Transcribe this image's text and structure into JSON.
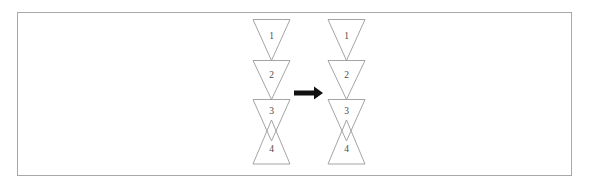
{
  "figure": {
    "title": "",
    "background_color": "#ffffff",
    "frame": {
      "border_color": "#a8a8a8",
      "x": 17,
      "y": 12,
      "width": 555,
      "height": 164
    },
    "stroke_color": "#9a9a9a",
    "label_color": "#4a4a4a",
    "arrow_color": "#111111"
  },
  "panels": [
    {
      "name": "left-panel",
      "center_x": 271.5,
      "triangles": [
        {
          "label": "1",
          "orientation": "down",
          "top": 19.5,
          "bottom": 60.5,
          "half_width": 18.5,
          "label_x": 271.5,
          "label_y": 37
        },
        {
          "label": "2",
          "orientation": "down",
          "top": 60.5,
          "bottom": 99.5,
          "half_width": 18.5,
          "label_x": 271.5,
          "label_y": 76
        },
        {
          "label": "3",
          "orientation": "down",
          "top": 99.5,
          "bottom": 141.0,
          "half_width": 18.5,
          "label_x": 271.5,
          "label_y": 112
        },
        {
          "label": "4",
          "orientation": "up",
          "top": 120.0,
          "bottom": 164.0,
          "half_width": 18.5,
          "label_x": 271.5,
          "label_y": 150
        }
      ]
    },
    {
      "name": "right-panel",
      "center_x": 346.5,
      "triangles": [
        {
          "label": "1",
          "orientation": "down",
          "top": 19.5,
          "bottom": 60.5,
          "half_width": 18.5,
          "label_x": 346.5,
          "label_y": 37
        },
        {
          "label": "2",
          "orientation": "down",
          "top": 60.5,
          "bottom": 99.5,
          "half_width": 18.5,
          "label_x": 346.5,
          "label_y": 76
        },
        {
          "label": "3",
          "orientation": "down",
          "top": 99.5,
          "bottom": 141.0,
          "half_width": 18.5,
          "label_x": 346.5,
          "label_y": 112
        },
        {
          "label": "4",
          "orientation": "up",
          "top": 120.0,
          "bottom": 164.0,
          "half_width": 18.5,
          "label_x": 346.5,
          "label_y": 150
        }
      ]
    }
  ],
  "arrow": {
    "name": "transformation-arrow",
    "direction": "right",
    "x1": 294,
    "x2": 323,
    "y": 93,
    "shaft_half_height": 2.6,
    "head_half_height": 6.5,
    "head_length": 9
  }
}
